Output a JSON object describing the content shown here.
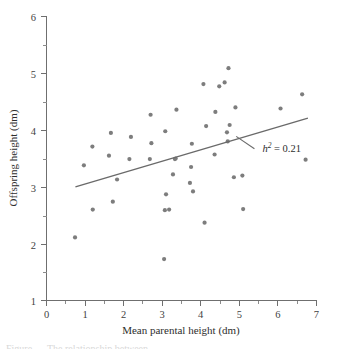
{
  "figure": {
    "background_color": "#ffffff",
    "point_color": "#7d7d7d",
    "line_color": "#6a6a6a",
    "axis_color": "#6f6f6f",
    "caption_partial": "Figure ....  The relationship between ..."
  },
  "chart_data": {
    "type": "scatter",
    "title": "",
    "xlabel": "Mean parental height (dm)",
    "ylabel": "Offspring height (dm)",
    "xlim": [
      0,
      7
    ],
    "ylim": [
      1,
      6
    ],
    "xticks": [
      0,
      1,
      2,
      3,
      4,
      5,
      6,
      7
    ],
    "xtick_labels": [
      "0",
      "1",
      "2",
      "3",
      "4",
      "5",
      "6",
      "7"
    ],
    "yticks": [
      1,
      2,
      3,
      4,
      5,
      6
    ],
    "ytick_labels": [
      "1",
      "2",
      "3",
      "4",
      "5",
      "6"
    ],
    "xminor_step": 0.5,
    "yminor_step": 0.5,
    "grid": false,
    "legend": false,
    "marker": "circle",
    "marker_size_px": 4.2,
    "points": [
      [
        0.74,
        2.11
      ],
      [
        0.97,
        3.38
      ],
      [
        1.19,
        3.71
      ],
      [
        1.2,
        2.6
      ],
      [
        1.62,
        3.55
      ],
      [
        1.67,
        3.95
      ],
      [
        1.72,
        2.74
      ],
      [
        1.83,
        3.13
      ],
      [
        2.15,
        3.49
      ],
      [
        2.19,
        3.88
      ],
      [
        2.68,
        3.49
      ],
      [
        2.7,
        4.27
      ],
      [
        2.72,
        3.77
      ],
      [
        3.05,
        1.73
      ],
      [
        3.07,
        2.59
      ],
      [
        3.08,
        3.98
      ],
      [
        3.1,
        2.87
      ],
      [
        3.18,
        2.6
      ],
      [
        3.28,
        3.22
      ],
      [
        3.33,
        3.49
      ],
      [
        3.35,
        3.5
      ],
      [
        3.37,
        4.36
      ],
      [
        3.72,
        3.07
      ],
      [
        3.75,
        3.35
      ],
      [
        3.77,
        3.76
      ],
      [
        3.8,
        2.92
      ],
      [
        4.07,
        4.81
      ],
      [
        4.1,
        2.37
      ],
      [
        4.14,
        4.07
      ],
      [
        4.36,
        3.57
      ],
      [
        4.38,
        4.32
      ],
      [
        4.48,
        4.77
      ],
      [
        4.62,
        4.84
      ],
      [
        4.68,
        3.96
      ],
      [
        4.7,
        3.8
      ],
      [
        4.72,
        5.09
      ],
      [
        4.75,
        4.09
      ],
      [
        4.86,
        3.17
      ],
      [
        4.9,
        4.4
      ],
      [
        5.08,
        3.2
      ],
      [
        5.1,
        2.61
      ],
      [
        6.07,
        4.38
      ],
      [
        6.63,
        4.63
      ],
      [
        6.72,
        3.48
      ]
    ],
    "regression_line": {
      "x_start": 0.75,
      "y_start": 3.0,
      "x_end": 6.78,
      "y_end": 4.21
    },
    "annotations": [
      {
        "symbol": "h",
        "superscript": "2",
        "equals": "=",
        "value": "0.21",
        "text": "h2 = 0.21",
        "x": 5.6,
        "y": 3.62,
        "leader_from_x": 4.92,
        "leader_from_y": 3.89
      }
    ]
  }
}
